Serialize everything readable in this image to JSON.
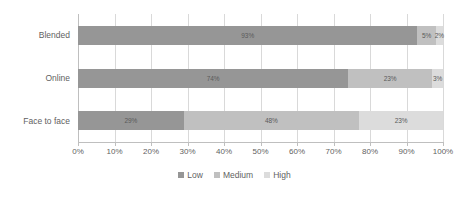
{
  "chart_data": {
    "type": "bar",
    "subtype": "stacked-horizontal-100-percent",
    "title": "",
    "subtitle": "",
    "xlabel": "",
    "ylabel": "",
    "orientation": "horizontal",
    "stacked": true,
    "grid": true,
    "legend_position": "bottom",
    "xlim": [
      0,
      100
    ],
    "categories": [
      "Blended",
      "Online",
      "Face to face"
    ],
    "tick_labels": [
      "0%",
      "10%",
      "20%",
      "30%",
      "40%",
      "50%",
      "60%",
      "70%",
      "80%",
      "90%",
      "100%"
    ],
    "tick_values": [
      0,
      10,
      20,
      30,
      40,
      50,
      60,
      70,
      80,
      90,
      100
    ],
    "series": [
      {
        "name": "Low",
        "color": "#969696",
        "values": [
          93,
          74,
          29
        ],
        "data_labels": [
          "93%",
          "74%",
          "29%"
        ]
      },
      {
        "name": "Medium",
        "color": "#c0c0c0",
        "values": [
          5,
          23,
          48
        ],
        "data_labels": [
          "5%",
          "23%",
          "48%"
        ]
      },
      {
        "name": "High",
        "color": "#dcdcdc",
        "values": [
          2,
          3,
          23
        ],
        "data_labels": [
          "2%",
          "3%",
          "23%"
        ]
      }
    ],
    "rows": [
      {
        "category": "Blended",
        "segments": [
          {
            "series": "Low",
            "value": 93,
            "label": "93%",
            "color": "#969696"
          },
          {
            "series": "Medium",
            "value": 5,
            "label": "5%",
            "color": "#c0c0c0"
          },
          {
            "series": "High",
            "value": 2,
            "label": "2%",
            "color": "#dcdcdc"
          }
        ]
      },
      {
        "category": "Online",
        "segments": [
          {
            "series": "Low",
            "value": 74,
            "label": "74%",
            "color": "#969696"
          },
          {
            "series": "Medium",
            "value": 23,
            "label": "23%",
            "color": "#c0c0c0"
          },
          {
            "series": "High",
            "value": 3,
            "label": "3%",
            "color": "#dcdcdc"
          }
        ]
      },
      {
        "category": "Face to face",
        "segments": [
          {
            "series": "Low",
            "value": 29,
            "label": "29%",
            "color": "#969696"
          },
          {
            "series": "Medium",
            "value": 48,
            "label": "48%",
            "color": "#c0c0c0"
          },
          {
            "series": "High",
            "value": 23,
            "label": "23%",
            "color": "#dcdcdc"
          }
        ]
      }
    ],
    "colors": {
      "low": "#969696",
      "medium": "#c0c0c0",
      "high": "#dcdcdc",
      "gridline": "#d9d9d9",
      "axis": "#bfbfbf",
      "text": "#5f5f5f",
      "background": "#ffffff"
    }
  },
  "legend": {
    "items": [
      {
        "label": "Low",
        "color": "#969696"
      },
      {
        "label": "Medium",
        "color": "#c0c0c0"
      },
      {
        "label": "High",
        "color": "#dcdcdc"
      }
    ]
  }
}
